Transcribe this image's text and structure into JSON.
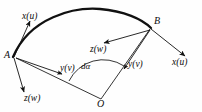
{
  "figure": {
    "type": "engineering-diagram",
    "background_color": "#fefefe",
    "stroke_color": "#111111",
    "arc": {
      "label": "curved-beam-arc",
      "start_point": "A",
      "end_point": "B"
    },
    "points": [
      {
        "id": "point-a",
        "label": "A",
        "x": 13,
        "y": 57
      },
      {
        "id": "point-b",
        "label": "B",
        "x": 150,
        "y": 28
      },
      {
        "id": "point-o",
        "label": "O",
        "x": 101,
        "y": 99
      }
    ],
    "angle": {
      "id": "angle-d-alpha",
      "label": "dα",
      "vertex": "O"
    },
    "axes_at_a": [
      {
        "id": "axis-a-x",
        "label": "x(u)",
        "direction": "up-left"
      },
      {
        "id": "axis-a-y",
        "label": "y(v)",
        "direction": "down-right"
      },
      {
        "id": "axis-a-z",
        "label": "z(w)",
        "direction": "down"
      }
    ],
    "axes_at_b": [
      {
        "id": "axis-b-x",
        "label": "x(u)",
        "direction": "down-right"
      },
      {
        "id": "axis-b-y",
        "label": "y(v)",
        "direction": "down-left"
      },
      {
        "id": "axis-b-z",
        "label": "z(w)",
        "direction": "left-down"
      }
    ],
    "labels": {
      "a_x": "x(u)",
      "a_z": "z(w)",
      "a_y": "y(v)",
      "b_x": "x(u)",
      "b_y": "y(v)",
      "b_z": "z(w)",
      "point_a": "A",
      "point_b": "B",
      "point_o": "O",
      "d_alpha": "dα"
    }
  }
}
